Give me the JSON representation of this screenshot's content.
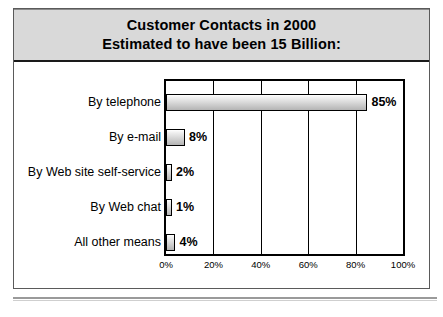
{
  "figure": {
    "title_line_1": "Customer Contacts in 2000",
    "title_line_2": "Estimated to have been 15 Billion:",
    "title_background_color": "#d9d9d9",
    "border_color": "#5a5a5a",
    "bar_outline_color": "#000000",
    "bar_fill_top_color": "#ffffff",
    "bar_fill_bottom_color": "#b4b4b4"
  },
  "chart_data": {
    "type": "bar",
    "orientation": "horizontal",
    "title": "Customer Contacts in 2000 Estimated to have been 15 Billion:",
    "xlabel": "",
    "ylabel": "",
    "xlim": [
      0,
      100
    ],
    "grid": true,
    "legend": "none",
    "categories": [
      "By telephone",
      "By e-mail",
      "By Web site self-service",
      "By Web chat",
      "All other means"
    ],
    "values": [
      85,
      8,
      2,
      1,
      4
    ],
    "value_labels": [
      "85%",
      "8%",
      "2%",
      "1%",
      "4%"
    ],
    "xticks": [
      0,
      20,
      40,
      60,
      80,
      100
    ],
    "xtick_labels": [
      "0%",
      "20%",
      "40%",
      "60%",
      "80%",
      "100%"
    ]
  }
}
